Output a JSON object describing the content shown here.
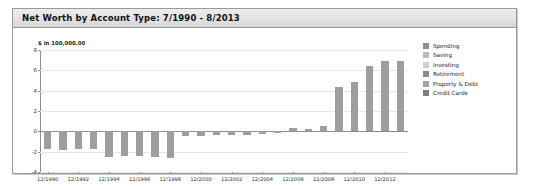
{
  "panel": {
    "title": "Net Worth by Account Type:  7/1990 - 8/2013"
  },
  "chart_data": {
    "type": "bar",
    "title": "Net Worth by Account Type:  7/1990 - 8/2013",
    "xlabel": "",
    "ylabel": "$ in 100,000.00",
    "ylim": [
      -4,
      8
    ],
    "yticks": [
      8,
      6,
      4,
      2,
      0,
      -2,
      -4
    ],
    "ytick_labels": [
      "8",
      "6",
      "4",
      "2",
      "0",
      "-2",
      "-4"
    ],
    "grid": true,
    "legend_position": "right",
    "bar_color": "#9e9e9e",
    "categories": [
      "12/1990",
      "12/1991",
      "12/1992",
      "12/1993",
      "12/1994",
      "12/1995",
      "12/1996",
      "12/1997",
      "12/1998",
      "12/1999",
      "12/2000",
      "12/2001",
      "12/2002",
      "12/2003",
      "12/2004",
      "12/2005",
      "12/2006",
      "12/2007",
      "12/2008",
      "12/2009",
      "12/2010",
      "12/2011",
      "12/2012",
      "8/2013"
    ],
    "xtick_labels": [
      "12/1990",
      "12/1992",
      "12/1994",
      "12/1996",
      "12/1998",
      "12/2000",
      "12/2002",
      "12/2004",
      "12/2006",
      "12/2008",
      "12/2010",
      "12/2012"
    ],
    "values": [
      -1.7,
      -1.8,
      -1.75,
      -1.7,
      -2.5,
      -2.45,
      -2.4,
      -2.5,
      -2.6,
      -0.5,
      -0.45,
      -0.4,
      -0.35,
      -0.35,
      -0.25,
      -0.2,
      0.3,
      0.25,
      0.55,
      4.4,
      4.9,
      6.4,
      6.9,
      6.9
    ],
    "legend": [
      {
        "label": "Spending",
        "color": "#8f8f8f"
      },
      {
        "label": "Saving",
        "color": "#b9b9b9"
      },
      {
        "label": "Investing",
        "color": "#cfcfcf"
      },
      {
        "label": "Retirement",
        "color": "#8a8a8a"
      },
      {
        "label": "Property & Debt",
        "color": "#a3a3a3"
      },
      {
        "label": "Credit Cards",
        "color": "#7d7d7d"
      }
    ]
  }
}
